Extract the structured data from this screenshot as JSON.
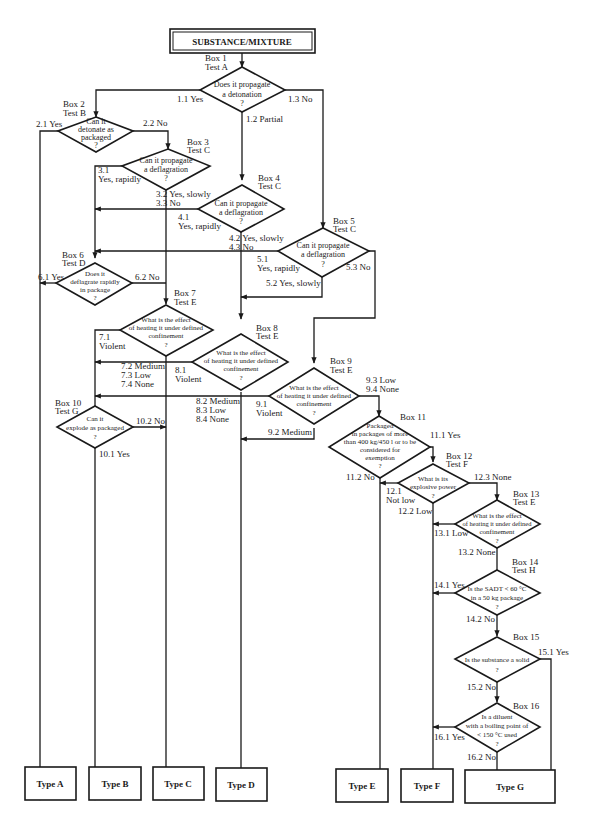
{
  "start": {
    "label": "SUBSTANCE/MIXTURE"
  },
  "decisions": [
    {
      "box": "Box 1",
      "test": "Test A",
      "question": [
        "Does it propagate",
        "a detonation",
        "?"
      ]
    },
    {
      "box": "Box 2",
      "test": "Test B",
      "question": [
        "Can it",
        "detonate as",
        "packaged",
        "?"
      ]
    },
    {
      "box": "Box 3",
      "test": "Test C",
      "question": [
        "Can it propagate",
        "a deflagration",
        "?"
      ]
    },
    {
      "box": "Box 4",
      "test": "Test C",
      "question": [
        "Can it propagate",
        "a deflagration",
        "?"
      ]
    },
    {
      "box": "Box 5",
      "test": "Test C",
      "question": [
        "Can it propagate",
        "a deflagration",
        "?"
      ]
    },
    {
      "box": "Box 6",
      "test": "Test D",
      "question": [
        "Does it",
        "deflagrate rapidly",
        "in package",
        "?"
      ]
    },
    {
      "box": "Box 7",
      "test": "Test E",
      "question": [
        "What is the effect",
        "of heating it under defined",
        "confinement",
        "?"
      ]
    },
    {
      "box": "Box 8",
      "test": "Test E",
      "question": [
        "What is the effect",
        "of heating it under defined",
        "confinement",
        "?"
      ]
    },
    {
      "box": "Box 9",
      "test": "Test E",
      "question": [
        "What is the effect",
        "of heating it under defined",
        "confinement",
        "?"
      ]
    },
    {
      "box": "Box 10",
      "test": "Test G",
      "question": [
        "Can it",
        "explode as packaged",
        "?"
      ]
    },
    {
      "box": "Box 11",
      "test": "",
      "question": [
        "Packaged",
        "in packages of more",
        "than 400 kg/450 l or to be",
        "considered for",
        "exemption",
        "?"
      ]
    },
    {
      "box": "Box 12",
      "test": "Test F",
      "question": [
        "What is its",
        "explosive power",
        "?"
      ]
    },
    {
      "box": "Box 13",
      "test": "Test E",
      "question": [
        "What is the effect",
        "of heating it under defined",
        "confinement",
        "?"
      ]
    },
    {
      "box": "Box 14",
      "test": "Test H",
      "question": [
        "Is the SADT < 60 °C",
        "in a 50 kg package",
        "?"
      ]
    },
    {
      "box": "Box 15",
      "test": "",
      "question": [
        "Is the substance a solid",
        "?"
      ]
    },
    {
      "box": "Box 16",
      "test": "",
      "question": [
        "Is a diluent",
        "with a boiling point of",
        "< 150 °C used",
        "?"
      ]
    }
  ],
  "edges": {
    "e1_1": "1.1 Yes",
    "e1_2": "1.2 Partial",
    "e1_3": "1.3 No",
    "e2_1": "2.1 Yes",
    "e2_2": "2.2 No",
    "e3_1a": "3.1",
    "e3_1b": "Yes, rapidly",
    "e3_2": "3.2 Yes, slowly",
    "e3_3": "3.3 No",
    "e4_1a": "4.1",
    "e4_1b": "Yes, rapidly",
    "e4_2": "4.2 Yes, slowly",
    "e4_3": "4.3 No",
    "e5_1a": "5.1",
    "e5_1b": "Yes, rapidly",
    "e5_2": "5.2 Yes, slowly",
    "e5_3": "5.3 No",
    "e6_1": "6.1 Yes",
    "e6_2": "6.2 No",
    "e7_1a": "7.1",
    "e7_1b": "Violent",
    "e7_2": "7.2 Medium",
    "e7_3": "7.3 Low",
    "e7_4": "7.4 None",
    "e8_1a": "8.1",
    "e8_1b": "Violent",
    "e8_2": "8.2 Medium",
    "e8_3": "8.3 Low",
    "e8_4": "8.4 None",
    "e9_1a": "9.1",
    "e9_1b": "Violent",
    "e9_2": "9.2 Medium",
    "e9_3": "9.3 Low",
    "e9_4": "9.4 None",
    "e10_1": "10.1 Yes",
    "e10_2": "10.2 No",
    "e11_1": "11.1 Yes",
    "e11_2": "11.2 No",
    "e12_1a": "12.1",
    "e12_1b": "Not low",
    "e12_2": "12.2 Low",
    "e12_3": "12.3 None",
    "e13_1": "13.1 Low",
    "e13_2": "13.2 None",
    "e14_1": "14.1 Yes",
    "e14_2": "14.2 No",
    "e15_1": "15.1 Yes",
    "e15_2": "15.2 No",
    "e16_1": "16.1 Yes",
    "e16_2": "16.2 No"
  },
  "terminals": [
    {
      "label": "Type A"
    },
    {
      "label": "Type B"
    },
    {
      "label": "Type C"
    },
    {
      "label": "Type D"
    },
    {
      "label": "Type E"
    },
    {
      "label": "Type F"
    },
    {
      "label": "Type G"
    }
  ]
}
